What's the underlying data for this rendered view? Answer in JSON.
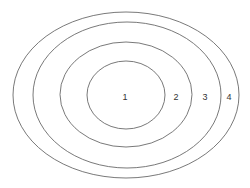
{
  "diagram": {
    "type": "concentric-ellipses",
    "stroke_color": "#6a6a6a",
    "rings": [
      {
        "label": "1",
        "cx": 126,
        "cy": 95,
        "rx": 39,
        "ry": 34,
        "label_x": 125,
        "label_y": 100
      },
      {
        "label": "2",
        "cx": 126,
        "cy": 94.5,
        "rx": 66,
        "ry": 52.5,
        "label_x": 176,
        "label_y": 100
      },
      {
        "label": "3",
        "cx": 127,
        "cy": 95,
        "rx": 94,
        "ry": 73,
        "label_x": 205,
        "label_y": 100
      },
      {
        "label": "4",
        "cx": 126,
        "cy": 95,
        "rx": 113,
        "ry": 83,
        "label_x": 229,
        "label_y": 100
      }
    ]
  }
}
